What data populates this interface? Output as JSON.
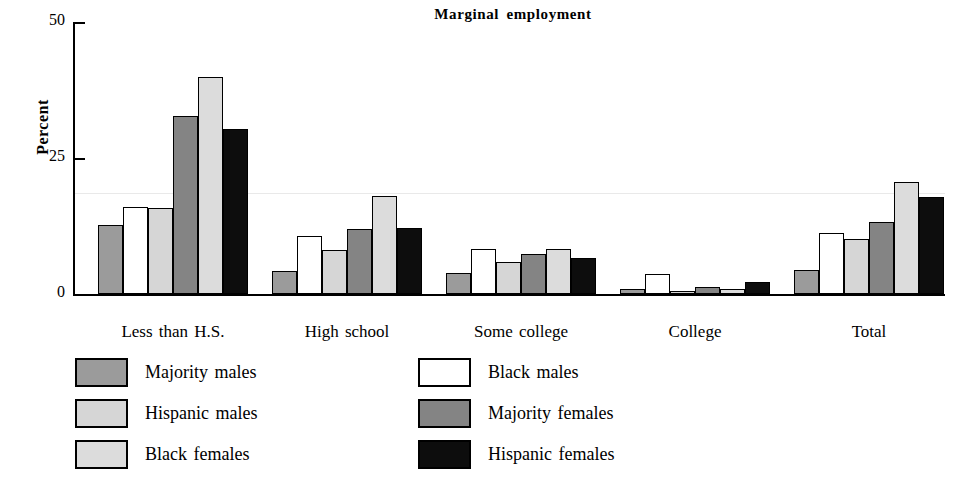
{
  "chart_data": {
    "type": "bar",
    "title": "Marginal employment",
    "xlabel": "",
    "ylabel": "Percent",
    "ylim": [
      0,
      50
    ],
    "yticks": [
      0,
      25,
      50
    ],
    "ytick_labels": [
      "0",
      "25",
      "50"
    ],
    "grid": false,
    "legend_position": "below-plot-two-columns",
    "categories": [
      "Less than H.S.",
      "High school",
      "Some college",
      "College",
      "Total"
    ],
    "series": [
      {
        "name": "Majority males",
        "color": "#9b9b9b",
        "values": [
          12.7,
          4.3,
          3.9,
          1.0,
          4.5
        ]
      },
      {
        "name": "Black males",
        "color": "#ffffff",
        "values": [
          16.0,
          10.7,
          8.2,
          3.6,
          11.3
        ]
      },
      {
        "name": "Hispanic males",
        "color": "#d6d6d6",
        "values": [
          15.9,
          8.0,
          5.9,
          0.4,
          10.1
        ]
      },
      {
        "name": "Majority females",
        "color": "#848484",
        "values": [
          32.7,
          11.9,
          7.3,
          1.3,
          13.2
        ]
      },
      {
        "name": "Black females",
        "color": "#dcdcdc",
        "values": [
          39.9,
          18.1,
          8.2,
          1.0,
          20.5
        ]
      },
      {
        "name": "Hispanic females",
        "color": "#0d0d0d",
        "values": [
          30.3,
          12.1,
          6.7,
          2.3,
          17.9
        ]
      }
    ]
  }
}
